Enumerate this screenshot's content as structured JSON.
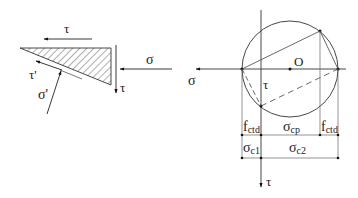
{
  "figure": {
    "type": "stress element and Mohr circle",
    "element": {
      "labels": {
        "tau_top": "τ",
        "tau_right": "τ",
        "sigma_right": "σ",
        "tau_prime": "τ'",
        "sigma_prime": "σ'"
      }
    },
    "mohr_circle": {
      "labels": {
        "sigma_axis": "σ",
        "tau_axis": "τ",
        "tau_axis_inner": "τ",
        "center": "O"
      },
      "dimensions": {
        "row1": [
          "f",
          "ctd",
          "σ",
          "cp",
          "f",
          "ctd"
        ],
        "row2": [
          "σ",
          "c1",
          "σ",
          "c2"
        ]
      },
      "dim_labels": {
        "fctd_left_main": "f",
        "fctd_left_sub": "ctd",
        "scp_main": "σ",
        "scp_sub": "cp",
        "fctd_right_main": "f",
        "fctd_right_sub": "ctd",
        "sc1_main": "σ",
        "sc1_sub": "c1",
        "sc2_main": "σ",
        "sc2_sub": "c2"
      }
    },
    "colors": {
      "line": "#333333",
      "ink": "#111111",
      "background": "#ffffff"
    }
  }
}
